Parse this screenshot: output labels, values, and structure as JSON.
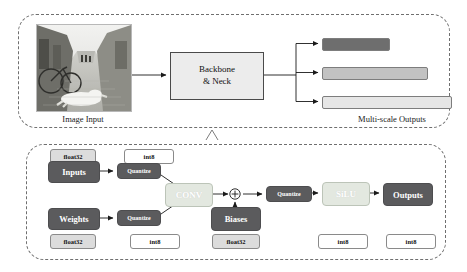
{
  "top_panel": {
    "image_caption": "Image Input",
    "image_alt": "grayscale street photo of a dog lying on a cobblestone street beside a bicycle",
    "backbone": {
      "line1": "Backbone",
      "line2": "& Neck"
    },
    "outputs_caption": "Multi-scale Outputs",
    "output_bars": [
      {
        "name": "small-scale-output",
        "color": "#6e6e6e"
      },
      {
        "name": "medium-scale-output",
        "color": "#c2c2c2"
      },
      {
        "name": "large-scale-output",
        "color": "#e6e6e6"
      }
    ]
  },
  "bottom_panel": {
    "nodes": {
      "inputs": "Inputs",
      "weights": "Weights",
      "quantize_inputs": "Quantize",
      "quantize_weights": "Quantize",
      "conv": "CONV",
      "biases": "Biases",
      "quantize_mid": "Quantize",
      "silu": "SiLU",
      "outputs": "Outputs"
    },
    "add_symbol": "⊕",
    "tags_top": [
      {
        "name": "inputs-dtype",
        "label": "float32",
        "kind": "f32"
      },
      {
        "name": "quantized-inputs-dtype",
        "label": "int8",
        "kind": "i8"
      }
    ],
    "tags_bottom": [
      {
        "name": "weights-dtype",
        "label": "float32",
        "kind": "f32"
      },
      {
        "name": "quantized-weights-dtype",
        "label": "int8",
        "kind": "i8"
      },
      {
        "name": "biases-dtype",
        "label": "float32",
        "kind": "f32"
      },
      {
        "name": "silu-input-dtype",
        "label": "int8",
        "kind": "i8"
      },
      {
        "name": "outputs-dtype",
        "label": "int8",
        "kind": "i8"
      }
    ]
  },
  "colors": {
    "dark_node": "#5b5b5d",
    "light_node": "#e3e8e0",
    "panel_border": "#6f6f6f",
    "backbone_fill": "#ececec",
    "tag_f32_fill": "#dcdcdc",
    "tag_i8_fill": "#ffffff",
    "wire": "#1a1a1a"
  }
}
